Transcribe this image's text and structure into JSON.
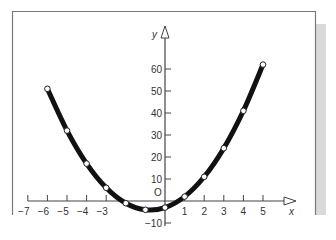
{
  "chart_data": {
    "type": "line",
    "title": "",
    "xlabel": "x",
    "ylabel": "y",
    "origin_label": "O",
    "x": [
      -6,
      -5,
      -4,
      -3,
      -2,
      -1,
      0,
      1,
      2,
      3,
      4,
      5
    ],
    "series": [
      {
        "name": "curve",
        "values": [
          51,
          32,
          17,
          6,
          -1,
          -4,
          -3,
          2,
          11,
          24,
          41,
          62
        ],
        "color": "#111111",
        "markers": "open-circle"
      }
    ],
    "x_ticks": [
      -7,
      -6,
      -5,
      -4,
      -3,
      1,
      2,
      3,
      4,
      5
    ],
    "x_tick_labels": [
      "−7",
      "−6",
      "−5",
      "−4",
      "−3",
      "1",
      "2",
      "3",
      "4",
      "5"
    ],
    "y_ticks": [
      60,
      50,
      40,
      30,
      20,
      10,
      -10
    ],
    "y_tick_labels": [
      "60",
      "50",
      "40",
      "30",
      "20",
      "10",
      "−10"
    ],
    "xlim": [
      -7,
      6
    ],
    "ylim": [
      -10,
      70
    ],
    "grid": false,
    "legend": "none"
  },
  "colors": {
    "frame": "#7a7a7a",
    "side_strip": "#d9d9d9",
    "axis": "#444444",
    "curve": "#111111"
  }
}
